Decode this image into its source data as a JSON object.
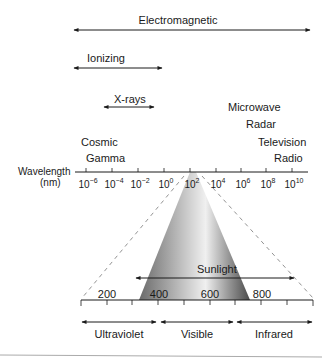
{
  "bands": {
    "electromagnetic": "Electromagnetic",
    "ionizing": "Ionizing",
    "xrays": "X-rays",
    "microwave": "Microwave",
    "radar": "Radar",
    "television": "Television",
    "radio": "Radio",
    "cosmic": "Cosmic",
    "gamma": "Gamma"
  },
  "axis": {
    "label_line1": "Wavelength",
    "label_line2": "(nm)",
    "base": "10",
    "exponents": [
      "−6",
      "−4",
      "−2",
      "0",
      "2",
      "4",
      "6",
      "8",
      "10"
    ]
  },
  "zoom_scale": {
    "ticks": [
      "200",
      "400",
      "600",
      "800"
    ],
    "sunlight": "Sunlight",
    "ranges": [
      "Ultraviolet",
      "Visible",
      "Infrared"
    ]
  },
  "colors": {
    "line": "#1a1a1a",
    "dashed": "#777777",
    "cone_dark": "#555555",
    "cone_light": "#e6e6e6",
    "footer_rule": "#aaaaaa"
  }
}
